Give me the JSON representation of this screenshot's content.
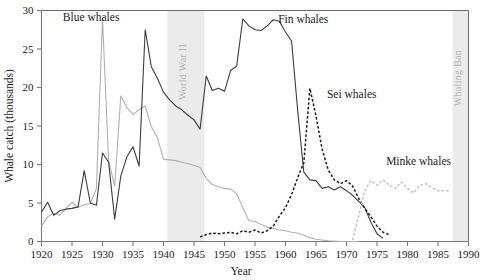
{
  "chart_data": {
    "type": "line",
    "title": "",
    "xlabel": "Year",
    "ylabel": "Whale catch (thousands)",
    "xlim": [
      1920,
      1990
    ],
    "ylim": [
      0,
      30
    ],
    "xticks": [
      1920,
      1925,
      1930,
      1935,
      1940,
      1945,
      1950,
      1955,
      1960,
      1965,
      1970,
      1975,
      1980,
      1985,
      1990
    ],
    "yticks": [
      0,
      5,
      10,
      15,
      20,
      25,
      30
    ],
    "grid": false,
    "legend_position": "inline-annotations",
    "bands": [
      {
        "name": "World War II",
        "label": "World War II",
        "x_start": 1940.6,
        "x_end": 1946.7,
        "color": "#ebebeb"
      },
      {
        "name": "Whaling Ban",
        "label": "Whaling Ban",
        "x_start": 1987.4,
        "x_end": 1990.0,
        "color": "#ebebeb"
      }
    ],
    "series": [
      {
        "name": "Blue whales",
        "label": "Blue whales",
        "color": "#b0b0b0",
        "style": "solid",
        "label_x": 1923.5,
        "label_y": 28.6,
        "x": [
          1920,
          1921,
          1922,
          1923,
          1924,
          1925,
          1926,
          1927,
          1928,
          1929,
          1930,
          1931,
          1932,
          1933,
          1934,
          1935,
          1936,
          1937,
          1938,
          1939,
          1940,
          1941,
          1942,
          1943,
          1944,
          1945,
          1946,
          1947,
          1948,
          1949,
          1950,
          1951,
          1952,
          1953,
          1954,
          1955,
          1956,
          1957,
          1958,
          1959,
          1960,
          1961,
          1962,
          1963,
          1964,
          1965,
          1966,
          1967,
          1968,
          1969,
          1970,
          1971,
          1972
        ],
        "y": [
          2.0,
          3.2,
          3.7,
          3.4,
          4.3,
          5.1,
          4.4,
          4.8,
          4.9,
          6.9,
          29.0,
          10.5,
          7.2,
          18.9,
          17.4,
          16.5,
          17.1,
          17.6,
          14.9,
          13.5,
          10.7,
          10.6,
          10.5,
          10.3,
          10.1,
          9.9,
          9.6,
          8.2,
          7.4,
          7.1,
          6.9,
          6.8,
          6.2,
          4.4,
          2.7,
          2.6,
          2.2,
          1.9,
          1.7,
          1.5,
          1.4,
          1.2,
          1.1,
          0.8,
          0.5,
          0.3,
          0.2,
          0.1,
          0.05,
          0.0,
          0.0,
          0.0,
          0.0
        ]
      },
      {
        "name": "Fin whales",
        "label": "Fin whales",
        "color": "#3c3c3c",
        "style": "solid",
        "label_x": 1958.8,
        "label_y": 28.4,
        "x": [
          1920,
          1921,
          1922,
          1923,
          1924,
          1925,
          1926,
          1927,
          1928,
          1929,
          1930,
          1931,
          1932,
          1933,
          1934,
          1935,
          1936,
          1937,
          1938,
          1939,
          1940,
          1941,
          1942,
          1943,
          1944,
          1945,
          1946,
          1947,
          1948,
          1949,
          1950,
          1951,
          1952,
          1953,
          1954,
          1955,
          1956,
          1957,
          1958,
          1959,
          1960,
          1961,
          1962,
          1963,
          1964,
          1965,
          1966,
          1967,
          1968,
          1969,
          1970,
          1971,
          1972,
          1973,
          1974,
          1975,
          1976
        ],
        "y": [
          3.8,
          5.1,
          3.4,
          4.0,
          4.2,
          4.3,
          4.5,
          9.2,
          5.0,
          4.7,
          11.5,
          10.3,
          2.9,
          8.5,
          11.0,
          12.3,
          9.8,
          27.5,
          22.7,
          21.2,
          19.4,
          18.4,
          17.6,
          17.1,
          16.4,
          15.8,
          14.6,
          21.5,
          19.6,
          19.9,
          19.5,
          22.2,
          22.8,
          28.9,
          28.0,
          27.5,
          27.4,
          28.0,
          28.8,
          28.6,
          27.2,
          26.0,
          17.0,
          9.0,
          8.0,
          7.9,
          6.9,
          7.1,
          6.7,
          7.1,
          6.6,
          6.0,
          5.2,
          4.4,
          2.5,
          1.0,
          0.4
        ]
      },
      {
        "name": "Sei whales",
        "label": "Sei whales",
        "color": "#1b1b1b",
        "style": "dashed",
        "label_x": 1966.8,
        "label_y": 18.6,
        "x": [
          1946,
          1947,
          1948,
          1949,
          1950,
          1951,
          1952,
          1953,
          1954,
          1955,
          1956,
          1957,
          1958,
          1959,
          1960,
          1961,
          1962,
          1963,
          1964,
          1965,
          1966,
          1967,
          1968,
          1969,
          1970,
          1971,
          1972,
          1973,
          1974,
          1975,
          1976,
          1977
        ],
        "y": [
          0.6,
          0.9,
          1.1,
          1.0,
          1.1,
          1.2,
          1.0,
          1.4,
          1.2,
          1.5,
          1.1,
          1.4,
          2.0,
          3.3,
          4.4,
          6.1,
          8.3,
          10.2,
          19.9,
          16.3,
          12.0,
          9.3,
          8.0,
          7.5,
          7.9,
          7.2,
          5.6,
          4.3,
          3.2,
          2.0,
          1.2,
          0.9
        ]
      },
      {
        "name": "Minke whales",
        "label": "Minke whales",
        "color": "#c2c2c2",
        "style": "dashed",
        "label_x": 1976.5,
        "label_y": 10.0,
        "x": [
          1971,
          1972,
          1973,
          1974,
          1975,
          1976,
          1977,
          1978,
          1979,
          1980,
          1981,
          1982,
          1983,
          1984,
          1985,
          1986,
          1987
        ],
        "y": [
          0.2,
          3.4,
          6.6,
          7.9,
          7.3,
          8.0,
          7.3,
          6.9,
          7.7,
          6.9,
          6.3,
          7.3,
          7.5,
          7.0,
          6.6,
          6.6,
          6.6
        ]
      }
    ]
  }
}
